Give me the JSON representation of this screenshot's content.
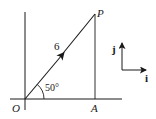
{
  "diagram": {
    "points": {
      "origin": "O",
      "tip": "P",
      "foot": "A"
    },
    "vector": {
      "magnitude_label": "6",
      "angle_label": "50°"
    },
    "unit_vectors": {
      "i_label": "i",
      "j_label": "j"
    },
    "colors": {
      "stroke": "#1a1a1a",
      "background": "#ffffff"
    }
  }
}
